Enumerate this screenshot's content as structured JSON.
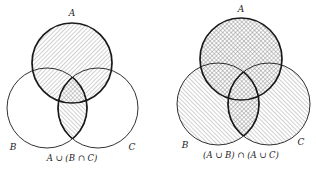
{
  "diagrams": [
    {
      "id": "left",
      "caption": "A ∪ (B ∩ C)",
      "sets": [
        {
          "label": "A",
          "cx": 72,
          "cy": 63,
          "r": 40,
          "label_x": 72,
          "label_y": 16
        },
        {
          "label": "B",
          "cx": 47,
          "cy": 108,
          "r": 40,
          "label_x": 13,
          "label_y": 150
        },
        {
          "label": "C",
          "cx": 98,
          "cy": 108,
          "r": 40,
          "label_x": 132,
          "label_y": 150
        }
      ],
      "shaded": {
        "A": "forward-hatch",
        "B∩C": "back-hatch",
        "A∩B∩C": "crosshatch"
      },
      "caption_x": 72,
      "caption_y": 161
    },
    {
      "id": "right",
      "caption": "(A ∪ B) ∩ (A ∪ C)",
      "sets": [
        {
          "label": "A",
          "cx": 241,
          "cy": 59,
          "r": 41,
          "label_x": 241,
          "label_y": 12
        },
        {
          "label": "B",
          "cx": 218,
          "cy": 104,
          "r": 41,
          "label_x": 185,
          "label_y": 148
        },
        {
          "label": "C",
          "cx": 269,
          "cy": 104,
          "r": 41,
          "label_x": 301,
          "label_y": 145
        }
      ],
      "shaded": {
        "A": "crosshatch",
        "B-only": "back-hatch",
        "C-only": "back-hatch",
        "B∩C": "crosshatch"
      },
      "caption_x": 241,
      "caption_y": 158
    }
  ],
  "colors": {
    "stroke": "#1a1a1a",
    "hatch": "#8a8a8a",
    "background": "#ffffff"
  }
}
